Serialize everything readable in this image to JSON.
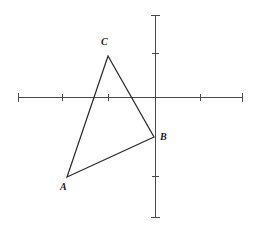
{
  "figure": {
    "background_color": "#ffffff",
    "width": 255,
    "height": 233
  },
  "axes": {
    "axis_color": "#4a4a4a",
    "origin_px": {
      "x": 155,
      "y": 97
    },
    "unit_px": {
      "x": 46,
      "y": 44
    },
    "x_axis": {
      "name": "x-axis",
      "start_px": {
        "x": 18,
        "y": 97
      },
      "end_px": {
        "x": 243,
        "y": 97
      },
      "tick_positions_px": [
        18,
        62,
        108,
        200,
        243
      ],
      "tick_labels": []
    },
    "y_axis": {
      "name": "y-axis",
      "start_px": {
        "x": 155,
        "y": 15
      },
      "end_px": {
        "x": 155,
        "y": 218
      },
      "tick_positions_px": [
        15,
        53,
        176,
        218
      ],
      "tick_labels": []
    }
  },
  "chart_data": {
    "type": "scatter",
    "xlabel": "",
    "ylabel": "",
    "grid": false,
    "legend": "none",
    "xlim": [
      -3,
      2
    ],
    "ylim": [
      -2.8,
      1.9
    ],
    "shapes": [
      {
        "name": "triangle-ABC",
        "type": "polygon",
        "closed": true,
        "stroke": "#2b2b2b",
        "fill": "none",
        "vertices": [
          {
            "label": "A",
            "x": -2.0,
            "y": -1.82,
            "px": {
              "x": 67,
              "y": 177
            }
          },
          {
            "label": "B",
            "x": -0.02,
            "y": -0.91,
            "px": {
              "x": 154,
              "y": 137
            }
          },
          {
            "label": "C",
            "x": -1.02,
            "y": 0.93,
            "px": {
              "x": 108,
              "y": 56
            }
          }
        ]
      }
    ],
    "point_labels": [
      {
        "text": "A",
        "anchor_vertex": "A",
        "px": {
          "x": 60,
          "y": 182
        }
      },
      {
        "text": "B",
        "anchor_vertex": "B",
        "px": {
          "x": 160,
          "y": 132
        }
      },
      {
        "text": "C",
        "anchor_vertex": "C",
        "px": {
          "x": 101,
          "y": 37
        }
      }
    ]
  },
  "labels": {
    "a": "A",
    "b": "B",
    "c": "C"
  }
}
